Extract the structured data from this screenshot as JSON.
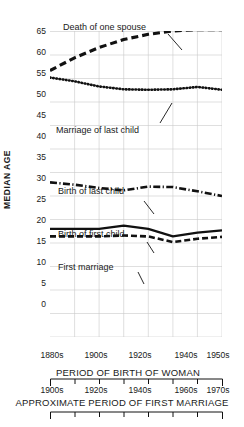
{
  "chart_data": {
    "type": "line",
    "title": "",
    "xlabel": "PERIOD OF BIRTH OF WOMAN",
    "xlabel_secondary": "APPROXIMATE PERIOD OF FIRST MARRIAGE",
    "ylabel": "MEDIAN AGE",
    "ylim": [
      0,
      67
    ],
    "yticks": [
      0,
      5,
      10,
      15,
      20,
      25,
      30,
      35,
      40,
      45,
      50,
      55,
      60,
      65
    ],
    "ytick_labels": [
      "0",
      "5",
      "10",
      "15",
      "20",
      "25",
      "30",
      "35",
      "40",
      "45",
      "50",
      "55",
      "60",
      "65"
    ],
    "grid": true,
    "legend_position": "inline-annotations",
    "x_axis_primary": {
      "label": "PERIOD OF BIRTH OF WOMAN",
      "tick_labels": [
        "1880s",
        "1900s",
        "1920s",
        "1940s",
        "1950s"
      ],
      "tick_positions": [
        1880,
        1900,
        1920,
        1940,
        1950
      ]
    },
    "x_axis_secondary": {
      "label": "APPROXIMATE PERIOD OF FIRST MARRIAGE",
      "tick_labels": [
        "1900s",
        "1920s",
        "1940s",
        "1960s",
        "1970s"
      ],
      "tick_positions": [
        1900,
        1920,
        1940,
        1960,
        1970
      ]
    },
    "x": [
      1880,
      1890,
      1900,
      1910,
      1920,
      1930,
      1940,
      1950
    ],
    "series": [
      {
        "name": "Death of one spouse",
        "style": "long-dash",
        "values": [
          56.7,
          59.4,
          61.6,
          63.3,
          64.4,
          65.1,
          65.4,
          65.4
        ]
      },
      {
        "name": "Marriage of last child",
        "style": "dotted",
        "values": [
          55.2,
          54.4,
          53.3,
          52.7,
          52.6,
          52.7,
          53.2,
          52.6
        ]
      },
      {
        "name": "Birth of last child",
        "style": "dash-dot",
        "values": [
          32.9,
          32.4,
          31.7,
          31.2,
          32.0,
          31.9,
          31.0,
          30.0
        ]
      },
      {
        "name": "Birth of first child",
        "style": "solid",
        "values": [
          23.0,
          23.0,
          23.0,
          23.7,
          23.0,
          21.4,
          22.2,
          22.7
        ]
      },
      {
        "name": "First marriage",
        "style": "dash",
        "values": [
          21.4,
          21.4,
          21.4,
          21.6,
          21.4,
          20.2,
          20.9,
          21.3
        ]
      }
    ],
    "annotations": [
      {
        "text": "Death of one spouse",
        "x": 1893,
        "y": 67.5
      },
      {
        "text": "Marriage of last child",
        "x": 1893,
        "y": 49.5
      },
      {
        "text": "Birth of last child",
        "x": 1893,
        "y": 35.8
      },
      {
        "text": "Birth of first child",
        "x": 1893,
        "y": 25.5
      },
      {
        "text": "First marriage",
        "x": 1893,
        "y": 18.8
      }
    ]
  },
  "labels": {
    "ylabel": "MEDIAN AGE",
    "series": {
      "death_of_one_spouse": "Death of one spouse",
      "marriage_of_last_child": "Marriage of last child",
      "birth_of_last_child": "Birth of last child",
      "birth_of_first_child": "Birth of first child",
      "first_marriage": "First marriage"
    },
    "yticks": {
      "t65": "65",
      "t60": "60",
      "t55": "55",
      "t50": "50",
      "t45": "45",
      "t40": "40",
      "t35": "35",
      "t30": "30",
      "t25": "25",
      "t20": "20",
      "t15": "15",
      "t10": "10",
      "t5": "5",
      "t0": "0"
    },
    "xticks_primary": {
      "x1": "1880s",
      "x2": "1900s",
      "x3": "1920s",
      "x4": "1940s",
      "x5": "1950s"
    },
    "xticks_secondary": {
      "x1": "1900s",
      "x2": "1920s",
      "x3": "1940s",
      "x4": "1960s",
      "x5": "1970s"
    },
    "caption_primary": "PERIOD OF BIRTH OF WOMAN",
    "caption_secondary": "APPROXIMATE PERIOD OF FIRST MARRIAGE"
  },
  "colors": {
    "ink": "#111111",
    "grid": "#c9c9c9",
    "background": "#ffffff"
  }
}
